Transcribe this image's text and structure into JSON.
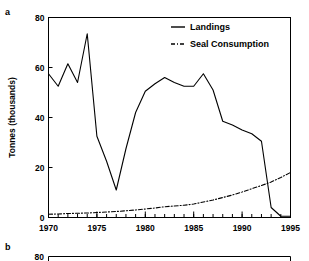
{
  "figure": {
    "panel_a_label": "a",
    "panel_b_label": "b"
  },
  "chart_data": {
    "type": "line",
    "title": "",
    "xlabel": "",
    "ylabel": "Tonnes (thousands)",
    "xlim": [
      1970,
      1995
    ],
    "ylim": [
      0,
      80
    ],
    "xticks": [
      1970,
      1975,
      1980,
      1985,
      1990,
      1995
    ],
    "xtick_labels": [
      "1970",
      "1975",
      "1980",
      "1985",
      "1990",
      "1995"
    ],
    "yticks": [
      0,
      20,
      40,
      60,
      80
    ],
    "ytick_labels": [
      "0",
      "20",
      "40",
      "60",
      "80"
    ],
    "minor_xtick_interval": 1,
    "grid": false,
    "frame": "box",
    "legend_position": "top-right",
    "x": [
      1970,
      1971,
      1972,
      1973,
      1974,
      1975,
      1976,
      1977,
      1978,
      1979,
      1980,
      1981,
      1982,
      1983,
      1984,
      1985,
      1986,
      1987,
      1988,
      1989,
      1990,
      1991,
      1992,
      1993,
      1994,
      1995
    ],
    "series": [
      {
        "name": "Landings",
        "line_style": "solid",
        "values": [
          57.5,
          52.5,
          61.5,
          54.0,
          73.5,
          32.5,
          22.5,
          11.0,
          27.5,
          42.0,
          50.5,
          53.5,
          56.0,
          54.0,
          52.5,
          52.5,
          57.5,
          51.0,
          38.5,
          37.0,
          35.0,
          33.5,
          30.5,
          4.0,
          0.5,
          0.5
        ]
      },
      {
        "name": "Seal Consumption",
        "line_style": "dash-dot",
        "values": [
          1.3,
          1.4,
          1.6,
          1.7,
          1.8,
          2.0,
          2.2,
          2.4,
          2.7,
          3.0,
          3.4,
          3.8,
          4.3,
          4.6,
          4.9,
          5.4,
          6.2,
          7.0,
          8.0,
          9.0,
          10.2,
          11.5,
          12.8,
          14.2,
          16.0,
          18.0
        ]
      }
    ]
  },
  "legend": {
    "items": [
      {
        "label": "Landings",
        "style": "solid"
      },
      {
        "label": "Seal Consumption",
        "style": "dash-dot"
      }
    ]
  },
  "panel_b": {
    "ytick_top_label": "80"
  }
}
